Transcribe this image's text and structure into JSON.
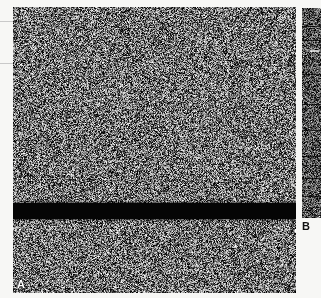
{
  "figure": {
    "width": 321,
    "height": 298,
    "background_color": "#f7f7f5",
    "type": "grayscale-autoradiograph-figure"
  },
  "panels": [
    {
      "id": "A",
      "label": "A",
      "label_color": "#ffffff",
      "description": "Large speckled grayscale noise field with a single solid black horizontal band",
      "x": 13,
      "y": 7,
      "width": 283,
      "height": 286,
      "band": {
        "name": "black-band",
        "color": "#050505",
        "top": 196,
        "height": 16
      }
    },
    {
      "id": "B",
      "label": "B",
      "label_color": "#111111",
      "description": "Narrow vertical lane strip of darker grayscale noise divided by faint horizontal separators",
      "x": 302,
      "y": 8,
      "width": 19,
      "height": 210,
      "separators": [
        18,
        32,
        66,
        96,
        122,
        148,
        170,
        188
      ],
      "marks": [
        {
          "top": 42,
          "left": 8,
          "width": 9
        }
      ]
    }
  ],
  "margin_ticks": {
    "color": "#c9c9c9",
    "lines": [
      {
        "y": 21,
        "width": 13
      },
      {
        "y": 63,
        "width": 13
      }
    ]
  },
  "chart_data": {
    "type": "heatmap",
    "title": "",
    "xlabel": "",
    "ylabel": "",
    "panel_labels": [
      "A",
      "B"
    ],
    "colormap": "grayscale",
    "value_range": [
      0,
      255
    ],
    "annotations": [
      {
        "panel": "A",
        "kind": "band",
        "position_fraction": 0.686,
        "thickness_fraction": 0.056,
        "intensity": 0
      },
      {
        "panel": "B",
        "kind": "lane-separators",
        "count": 8
      }
    ]
  }
}
